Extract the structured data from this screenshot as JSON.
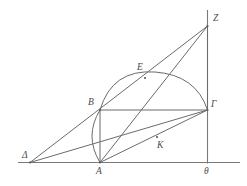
{
  "figure": {
    "kind": "geometric-construction-diagram",
    "background_color": "#ffffff",
    "stroke_color": "#6b6b6b",
    "label_color": "#4a4a4a",
    "width": 247,
    "height": 186,
    "points": {
      "delta": {
        "label": "Δ",
        "x": 30,
        "y": 162.5,
        "label_x": 22,
        "label_y": 151
      },
      "a": {
        "label": "A",
        "x": 100,
        "y": 162.5,
        "label_x": 96,
        "label_y": 167
      },
      "b": {
        "label": "B",
        "x": 100,
        "y": 110,
        "label_x": 88,
        "label_y": 98
      },
      "e": {
        "label": "E",
        "x": 145,
        "y": 78,
        "label_x": 137,
        "label_y": 63
      },
      "k": {
        "label": "K",
        "x": 157,
        "y": 137,
        "label_x": 157,
        "label_y": 141
      },
      "gamma": {
        "label": "Γ",
        "x": 207.5,
        "y": 110,
        "label_x": 211,
        "label_y": 100
      },
      "z": {
        "label": "Z",
        "x": 207.5,
        "y": 26,
        "label_x": 213,
        "label_y": 14
      },
      "theta": {
        "label": "θ",
        "x": 207.5,
        "y": 162.5,
        "label_x": 204,
        "label_y": 167
      }
    },
    "baseline": {
      "name": "horizontal-axis",
      "x1": 18,
      "y1": 162.5,
      "x2": 240,
      "y2": 162.5
    },
    "vertical_axis": {
      "name": "vertical-axis-through-theta",
      "x1": 207.5,
      "y1": 10,
      "x2": 207.5,
      "y2": 163.5
    },
    "segments": [
      {
        "name": "segment-delta-z",
        "from": "delta",
        "to": "z"
      },
      {
        "name": "segment-delta-gamma",
        "from": "delta",
        "to": "gamma"
      },
      {
        "name": "segment-delta-a",
        "from": "delta",
        "to": "a"
      },
      {
        "name": "segment-a-z",
        "from": "a",
        "to": "z"
      },
      {
        "name": "segment-a-b",
        "from": "a",
        "to": "b"
      },
      {
        "name": "segment-a-gamma",
        "from": "a",
        "to": "gamma"
      },
      {
        "name": "segment-b-gamma",
        "from": "b",
        "to": "gamma"
      },
      {
        "name": "segment-gamma-z",
        "from": "gamma",
        "to": "z"
      },
      {
        "name": "segment-b-theta-foot",
        "from": "b",
        "to": "theta"
      }
    ],
    "arcs": [
      {
        "name": "semicircle-b-e-gamma",
        "through": [
          "B",
          "E",
          "Γ"
        ],
        "apex_x": 155,
        "apex_y": 72
      },
      {
        "name": "small-arc-b-a",
        "through": [
          "B",
          "A"
        ],
        "bulge_x": 88
      }
    ]
  }
}
